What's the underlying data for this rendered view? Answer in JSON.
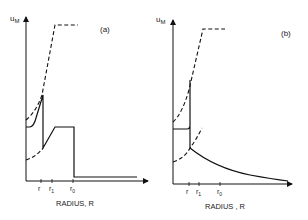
{
  "figure": {
    "panels": [
      {
        "id": "a",
        "panel_label": "(a)",
        "y_axis_label": "u",
        "y_axis_subscript": "M",
        "x_axis_label": "RADIUS, R",
        "ticks": [
          {
            "label": "r",
            "sub": ""
          },
          {
            "label": "r",
            "sub": "1"
          },
          {
            "label": "r",
            "sub": "0"
          }
        ]
      },
      {
        "id": "b",
        "panel_label": "(b)",
        "y_axis_label": "u",
        "y_axis_subscript": "M",
        "x_axis_label": "RADIUS , R",
        "ticks": [
          {
            "label": "r",
            "sub": ""
          },
          {
            "label": "r",
            "sub": "1"
          },
          {
            "label": "r",
            "sub": "0"
          }
        ]
      }
    ]
  }
}
